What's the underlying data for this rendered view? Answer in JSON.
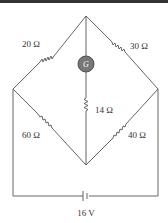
{
  "diagram": {
    "type": "wheatstone-bridge",
    "resistors": {
      "top_left": "20 Ω",
      "top_right": "30 Ω",
      "bottom_left": "60 Ω",
      "bottom_right": "40 Ω",
      "center": "14 Ω"
    },
    "galvanometer": "G",
    "battery": "16 V"
  }
}
